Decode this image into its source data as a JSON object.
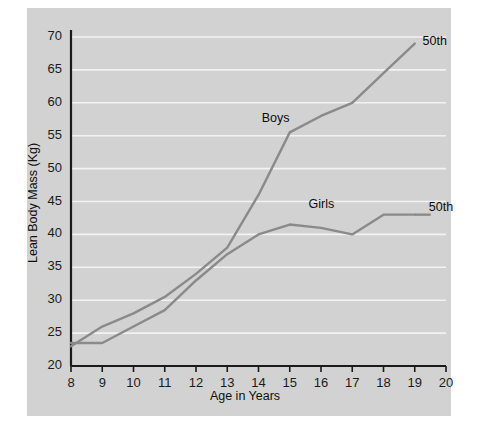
{
  "chart_data": {
    "type": "line",
    "title": "",
    "xlabel": "Age in Years",
    "ylabel": "Lean Body Mass (Kg)",
    "xlim": [
      8,
      20
    ],
    "ylim": [
      20,
      70
    ],
    "xticks": [
      "8",
      "9",
      "10",
      "11",
      "12",
      "13",
      "14",
      "15",
      "16",
      "17",
      "18",
      "19",
      "20"
    ],
    "yticks": [
      "20",
      "25",
      "30",
      "35",
      "40",
      "45",
      "50",
      "55",
      "60",
      "65",
      "70"
    ],
    "grid": "horizontal",
    "legend": "inline-annotations",
    "background_color": "#d2d2d2",
    "gridline_color": "#f2f2f2",
    "line_color": "#8a8a8a",
    "axis_color": "#1a1a1a",
    "series": [
      {
        "name": "Boys",
        "percentile_label": "50th",
        "x": [
          8,
          9,
          10,
          11,
          12,
          13,
          14,
          15,
          16,
          17,
          18,
          19
        ],
        "values": [
          23.0,
          26.0,
          28.0,
          30.5,
          34.0,
          38.0,
          46.0,
          55.5,
          58.0,
          60.0,
          64.5,
          69.0
        ]
      },
      {
        "name": "Girls",
        "percentile_label": "50th",
        "x": [
          8,
          9,
          10,
          11,
          12,
          13,
          14,
          15,
          16,
          17,
          18,
          19
        ],
        "values": [
          23.5,
          23.5,
          26.0,
          28.5,
          33.0,
          37.0,
          40.0,
          41.5,
          41.0,
          40.0,
          43.0,
          43.0
        ]
      }
    ],
    "annotations": [
      {
        "text": "Boys",
        "x": 14.1,
        "y": 57.5
      },
      {
        "text": "Girls",
        "x": 15.6,
        "y": 44.5
      },
      {
        "text": "50th",
        "x": 19.25,
        "y": 69.2
      },
      {
        "text": "50th",
        "x": 19.45,
        "y": 44.0
      }
    ]
  }
}
